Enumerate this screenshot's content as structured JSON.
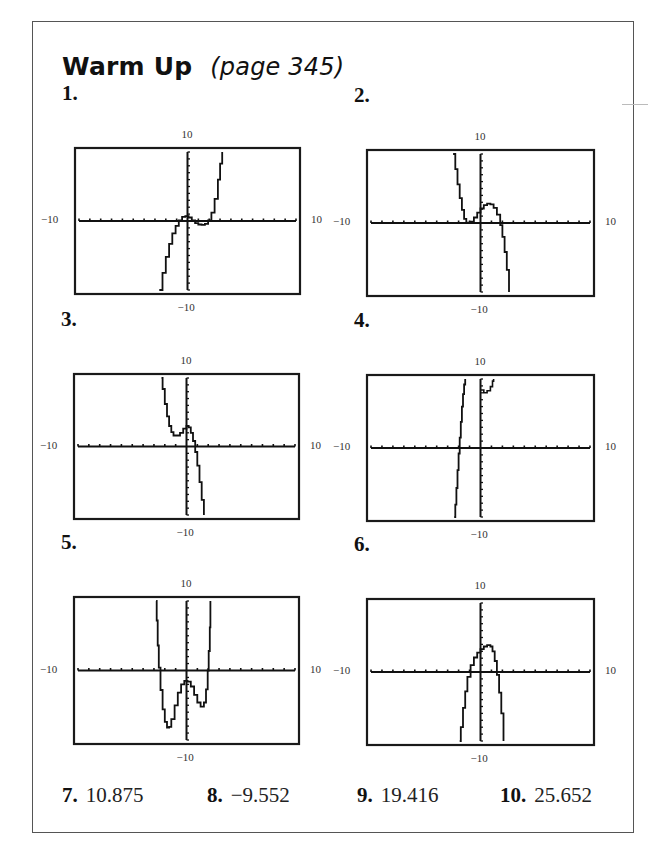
{
  "header": {
    "title": "Warm Up",
    "subtitle": "(page 345)"
  },
  "window": {
    "xmin": -10,
    "xmax": 10,
    "ymin": -10,
    "ymax": 10,
    "xscl": 1,
    "yscl": 1
  },
  "axis_labels": {
    "top": "10",
    "bottom": "−10",
    "left": "−10",
    "right": "10"
  },
  "graphs": [
    {
      "number": "1.",
      "box": {
        "x": 74,
        "y": 147,
        "w": 227,
        "h": 148
      },
      "points": [
        [
          -2.6,
          -10
        ],
        [
          -2.3,
          -7.5
        ],
        [
          -2.0,
          -5.2
        ],
        [
          -1.7,
          -3.3
        ],
        [
          -1.4,
          -1.8
        ],
        [
          -1.1,
          -0.7
        ],
        [
          -0.8,
          0.1
        ],
        [
          -0.5,
          0.6
        ],
        [
          -0.2,
          0.7
        ],
        [
          0.1,
          0.5
        ],
        [
          0.4,
          0.1
        ],
        [
          0.7,
          -0.3
        ],
        [
          1.0,
          -0.5
        ],
        [
          1.3,
          -0.55
        ],
        [
          1.6,
          -0.4
        ],
        [
          1.9,
          0.1
        ],
        [
          2.2,
          1.2
        ],
        [
          2.5,
          3.2
        ],
        [
          2.8,
          6.0
        ],
        [
          3.0,
          8.3
        ],
        [
          3.2,
          10
        ]
      ]
    },
    {
      "number": "2.",
      "box": {
        "x": 366,
        "y": 149,
        "w": 229,
        "h": 148
      },
      "points": [
        [
          -2.5,
          10
        ],
        [
          -2.3,
          7.8
        ],
        [
          -2.1,
          5.6
        ],
        [
          -1.9,
          3.6
        ],
        [
          -1.7,
          1.9
        ],
        [
          -1.5,
          0.6
        ],
        [
          -1.3,
          0.05
        ],
        [
          -1.1,
          0.0
        ],
        [
          -0.9,
          0.2
        ],
        [
          -0.6,
          0.8
        ],
        [
          -0.3,
          1.5
        ],
        [
          0,
          2.1
        ],
        [
          0.3,
          2.6
        ],
        [
          0.6,
          2.8
        ],
        [
          0.9,
          2.7
        ],
        [
          1.2,
          2.2
        ],
        [
          1.5,
          1.2
        ],
        [
          1.8,
          -0.3
        ],
        [
          2.0,
          -2.0
        ],
        [
          2.2,
          -4.2
        ],
        [
          2.4,
          -6.8
        ],
        [
          2.6,
          -10
        ]
      ]
    },
    {
      "number": "3.",
      "box": {
        "x": 73,
        "y": 373,
        "w": 227,
        "h": 147
      },
      "points": [
        [
          -2.3,
          10
        ],
        [
          -2.2,
          8.4
        ],
        [
          -2.0,
          6.2
        ],
        [
          -1.8,
          4.4
        ],
        [
          -1.6,
          3.0
        ],
        [
          -1.4,
          2.1
        ],
        [
          -1.2,
          1.6
        ],
        [
          -0.9,
          1.6
        ],
        [
          -0.6,
          2.0
        ],
        [
          -0.3,
          2.6
        ],
        [
          0,
          3.0
        ],
        [
          0.2,
          2.8
        ],
        [
          0.4,
          2.0
        ],
        [
          0.6,
          0.8
        ],
        [
          0.8,
          -0.8
        ],
        [
          1.0,
          -2.8
        ],
        [
          1.2,
          -5.2
        ],
        [
          1.4,
          -7.8
        ],
        [
          1.6,
          -10
        ]
      ]
    },
    {
      "number": "4.",
      "box": {
        "x": 366,
        "y": 374,
        "w": 229,
        "h": 148
      },
      "points": [
        [
          -2.4,
          -10
        ],
        [
          -2.3,
          -8.2
        ],
        [
          -2.2,
          -5.8
        ],
        [
          -2.1,
          -3.2
        ],
        [
          -2.0,
          -0.8
        ],
        [
          -1.9,
          1.5
        ],
        [
          -1.8,
          3.8
        ],
        [
          -1.7,
          6.0
        ],
        [
          -1.6,
          7.8
        ],
        [
          -1.5,
          9.2
        ],
        [
          -1.4,
          10
        ]
      ],
      "extra": [
        [
          0.0,
          8.4
        ],
        [
          0.3,
          8.0
        ],
        [
          0.6,
          8.3
        ],
        [
          0.9,
          8.9
        ],
        [
          1.1,
          9.7
        ],
        [
          1.2,
          10
        ]
      ]
    },
    {
      "number": "5.",
      "box": {
        "x": 73,
        "y": 596,
        "w": 227,
        "h": 149
      },
      "points": [
        [
          -2.8,
          10
        ],
        [
          -2.75,
          7.2
        ],
        [
          -2.65,
          3.6
        ],
        [
          -2.55,
          0.4
        ],
        [
          -2.4,
          -2.8
        ],
        [
          -2.2,
          -5.6
        ],
        [
          -2.0,
          -7.4
        ],
        [
          -1.8,
          -8.2
        ],
        [
          -1.6,
          -8.1
        ],
        [
          -1.4,
          -7.0
        ],
        [
          -1.1,
          -5.0
        ],
        [
          -0.8,
          -3.2
        ],
        [
          -0.5,
          -2.0
        ],
        [
          -0.2,
          -1.5
        ],
        [
          0.1,
          -1.6
        ],
        [
          0.4,
          -2.3
        ],
        [
          0.7,
          -3.5
        ],
        [
          1.0,
          -4.6
        ],
        [
          1.3,
          -5.2
        ],
        [
          1.6,
          -4.6
        ],
        [
          1.8,
          -2.7
        ],
        [
          1.95,
          0
        ],
        [
          2.05,
          2.8
        ],
        [
          2.15,
          6.2
        ],
        [
          2.2,
          10
        ]
      ]
    },
    {
      "number": "6.",
      "box": {
        "x": 366,
        "y": 598,
        "w": 229,
        "h": 148
      },
      "points": [
        [
          -1.9,
          -10
        ],
        [
          -1.8,
          -8.0
        ],
        [
          -1.6,
          -5.2
        ],
        [
          -1.4,
          -2.8
        ],
        [
          -1.2,
          -0.7
        ],
        [
          -0.9,
          1.0
        ],
        [
          -0.6,
          2.1
        ],
        [
          -0.3,
          2.8
        ],
        [
          0,
          3.3
        ],
        [
          0.3,
          3.7
        ],
        [
          0.6,
          3.9
        ],
        [
          0.9,
          3.7
        ],
        [
          1.1,
          3.0
        ],
        [
          1.3,
          1.6
        ],
        [
          1.5,
          -0.4
        ],
        [
          1.7,
          -3.0
        ],
        [
          1.9,
          -6.0
        ],
        [
          2.1,
          -10
        ]
      ]
    }
  ],
  "answers": [
    {
      "number": "7.",
      "value": "10.875"
    },
    {
      "number": "8.",
      "value": "−9.552"
    },
    {
      "number": "9.",
      "value": "19.416"
    },
    {
      "number": "10.",
      "value": "25.652"
    }
  ],
  "colors": {
    "ink": "#1a1a1a",
    "frame": "#555555",
    "label": "#333333"
  }
}
